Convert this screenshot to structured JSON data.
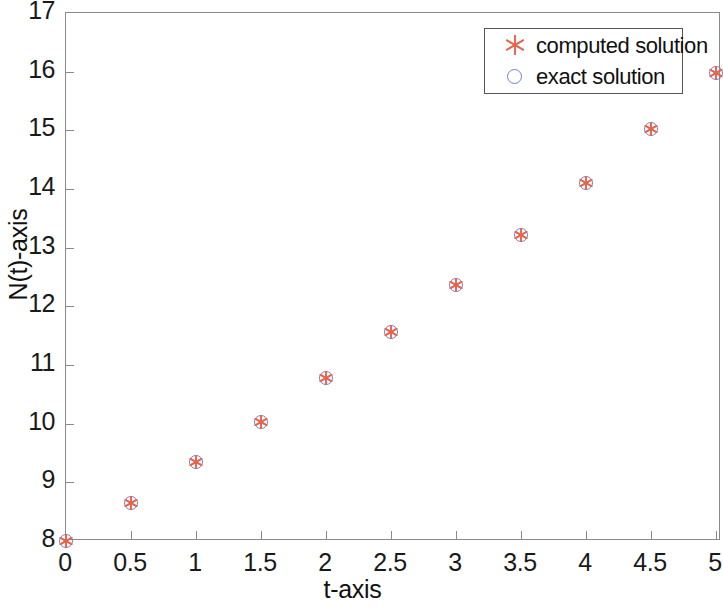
{
  "chart_data": {
    "type": "scatter",
    "title": "",
    "xlabel": "t-axis",
    "ylabel": "N(t)-axis",
    "xlim": [
      0,
      5
    ],
    "ylim": [
      8,
      17
    ],
    "grid": false,
    "legend_position": "top-right",
    "x_ticks": [
      "0",
      "0.5",
      "1",
      "1.5",
      "2",
      "2.5",
      "3",
      "3.5",
      "4",
      "4.5",
      "5"
    ],
    "x_tick_values": [
      0,
      0.5,
      1,
      1.5,
      2,
      2.5,
      3,
      3.5,
      4,
      4.5,
      5
    ],
    "y_ticks": [
      "8",
      "9",
      "10",
      "11",
      "12",
      "13",
      "14",
      "15",
      "16",
      "17"
    ],
    "y_tick_values": [
      8,
      9,
      10,
      11,
      12,
      13,
      14,
      15,
      16,
      17
    ],
    "x": [
      0,
      0.5,
      1,
      1.5,
      2,
      2.5,
      3,
      3.5,
      4,
      4.5,
      5
    ],
    "series": [
      {
        "name": "computed solution",
        "marker": "asterisk",
        "color": "#e8634a",
        "values": [
          8.0,
          8.65,
          9.34,
          10.03,
          10.78,
          11.56,
          12.37,
          13.22,
          14.1,
          15.02,
          15.98
        ]
      },
      {
        "name": "exact solution",
        "marker": "open-circle",
        "color": "#6f7fd0",
        "values": [
          8.0,
          8.65,
          9.34,
          10.03,
          10.78,
          11.56,
          12.37,
          13.22,
          14.1,
          15.02,
          15.98
        ]
      }
    ]
  },
  "legend": {
    "entries": [
      {
        "label": "computed solution",
        "marker": "asterisk-icon"
      },
      {
        "label": "exact solution",
        "marker": "circle-icon"
      }
    ]
  },
  "axes": {
    "x_title": "t-axis",
    "y_title": "N(t)-axis"
  },
  "colors": {
    "computed": "#e8634a",
    "exact": "#6f7fd0",
    "frame": "#8a8a8a",
    "text": "#111111",
    "background": "#ffffff"
  }
}
